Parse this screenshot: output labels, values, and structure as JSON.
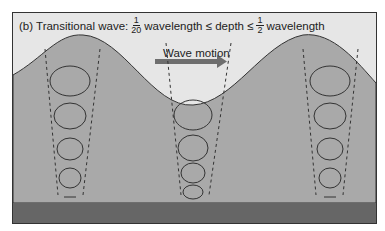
{
  "title": {
    "prefix": "(b) Transitional wave:",
    "frac1_num": "1",
    "frac1_den": "20",
    "mid": "wavelength ≤ depth ≤",
    "frac2_num": "1",
    "frac2_den": "2",
    "suffix": "wavelength"
  },
  "arrow_label": "Wave motion",
  "colors": {
    "air": "#e6e6e6",
    "water": "#a9a9a9",
    "seabed": "#666666",
    "arrow": "#6e6e6e",
    "line": "#333333"
  },
  "orbit_columns": [
    {
      "position": "crest-left",
      "orbits": 4
    },
    {
      "position": "trough",
      "orbits": 4
    },
    {
      "position": "crest-right",
      "orbits": 4
    }
  ]
}
